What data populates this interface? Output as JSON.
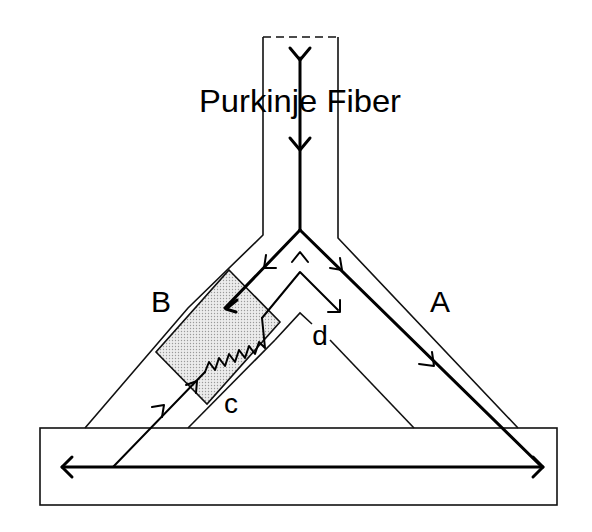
{
  "diagram": {
    "title": "Purkinje Fiber",
    "labels": {
      "branch_a": "A",
      "branch_b": "B",
      "point_c": "c",
      "point_d": "d"
    },
    "elements": {
      "fiber_source": "Purkinje fiber trunk (dashed open top)",
      "depressed_zone": "shaded block region on branch B",
      "muscle_strip": "ventricular muscle (bottom rectangle)"
    },
    "colors": {
      "line": "#000000",
      "shading": "#d9d9d9",
      "background": "#ffffff"
    }
  }
}
